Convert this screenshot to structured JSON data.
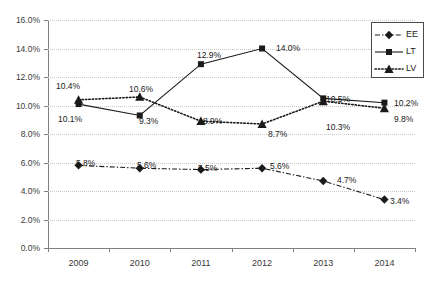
{
  "chart_data": {
    "type": "line",
    "title": "",
    "xlabel": "",
    "ylabel": "",
    "categories": [
      "2009",
      "2010",
      "2011",
      "2012",
      "2013",
      "2014"
    ],
    "ylim": [
      0,
      16
    ],
    "ytick_step": 2,
    "ytick_labels": [
      "0.0%",
      "2.0%",
      "4.0%",
      "6.0%",
      "8.0%",
      "10.0%",
      "12.0%",
      "14.0%",
      "16.0%"
    ],
    "grid": true,
    "legend_position": "top-right",
    "series": [
      {
        "name": "EE",
        "marker": "diamond",
        "linestyle": "dash-dot",
        "color": "#1a1a1a",
        "values": [
          5.8,
          5.6,
          5.5,
          5.6,
          4.7,
          3.4
        ],
        "labels": [
          "5.8%",
          "5.6%",
          "5.5%",
          "5.6%",
          "4.7%",
          "3.4%"
        ]
      },
      {
        "name": "LT",
        "marker": "square",
        "linestyle": "solid",
        "color": "#1a1a1a",
        "values": [
          10.1,
          9.3,
          12.9,
          14.0,
          10.5,
          10.2
        ],
        "labels": [
          "10.1%",
          "9.3%",
          "12.9%",
          "14.0%",
          "10.5%",
          "10.2%"
        ]
      },
      {
        "name": "LV",
        "marker": "triangle",
        "linestyle": "dotted",
        "color": "#1a1a1a",
        "values": [
          10.4,
          10.6,
          8.9,
          8.7,
          10.3,
          9.8
        ],
        "labels": [
          "10.4%",
          "10.6%",
          "8.9%",
          "8.7%",
          "10.3%",
          "9.8%"
        ]
      }
    ]
  },
  "axis": {
    "y_ticks": [
      {
        "label": "16.0%",
        "value": 16
      },
      {
        "label": "14.0%",
        "value": 14
      },
      {
        "label": "12.0%",
        "value": 12
      },
      {
        "label": "10.0%",
        "value": 10
      },
      {
        "label": "8.0%",
        "value": 8
      },
      {
        "label": "6.0%",
        "value": 6
      },
      {
        "label": "4.0%",
        "value": 4
      },
      {
        "label": "2.0%",
        "value": 2
      },
      {
        "label": "0.0%",
        "value": 0
      }
    ],
    "x_ticks": [
      "2009",
      "2010",
      "2011",
      "2012",
      "2013",
      "2014"
    ]
  },
  "legend": {
    "entries": [
      {
        "label": "EE",
        "marker": "diamond",
        "linestyle": "dash-dot"
      },
      {
        "label": "LT",
        "marker": "square",
        "linestyle": "solid"
      },
      {
        "label": "LV",
        "marker": "triangle",
        "linestyle": "dotted"
      }
    ]
  },
  "value_labels": [
    {
      "series": "LV",
      "year": "2009",
      "text": "10.4%",
      "x": 56,
      "y": 82
    },
    {
      "series": "LT",
      "year": "2009",
      "text": "10.1%",
      "x": 58,
      "y": 115
    },
    {
      "series": "EE",
      "year": "2009",
      "text": "5.8%",
      "x": 76,
      "y": 159
    },
    {
      "series": "LV",
      "year": "2010",
      "text": "10.6%",
      "x": 129,
      "y": 85
    },
    {
      "series": "LT",
      "year": "2010",
      "text": "9.3%",
      "x": 139,
      "y": 117
    },
    {
      "series": "EE",
      "year": "2010",
      "text": "5.6%",
      "x": 137,
      "y": 161
    },
    {
      "series": "LT",
      "year": "2011",
      "text": "12.9%",
      "x": 197,
      "y": 51
    },
    {
      "series": "LV",
      "year": "2011",
      "text": "8.9%",
      "x": 203,
      "y": 117
    },
    {
      "series": "EE",
      "year": "2011",
      "text": "5.5%",
      "x": 198,
      "y": 164
    },
    {
      "series": "LT",
      "year": "2012",
      "text": "14.0%",
      "x": 276,
      "y": 44
    },
    {
      "series": "LV",
      "year": "2012",
      "text": "8.7%",
      "x": 268,
      "y": 130
    },
    {
      "series": "EE",
      "year": "2012",
      "text": "5.6%",
      "x": 270,
      "y": 162
    },
    {
      "series": "LT",
      "year": "2013",
      "text": "10.5%",
      "x": 326,
      "y": 95
    },
    {
      "series": "LV",
      "year": "2013",
      "text": "10.3%",
      "x": 326,
      "y": 123
    },
    {
      "series": "EE",
      "year": "2013",
      "text": "4.7%",
      "x": 337,
      "y": 176
    },
    {
      "series": "LT",
      "year": "2014",
      "text": "10.2%",
      "x": 394,
      "y": 99
    },
    {
      "series": "LV",
      "year": "2014",
      "text": "9.8%",
      "x": 394,
      "y": 115
    },
    {
      "series": "EE",
      "year": "2014",
      "text": "3.4%",
      "x": 390,
      "y": 197
    }
  ]
}
